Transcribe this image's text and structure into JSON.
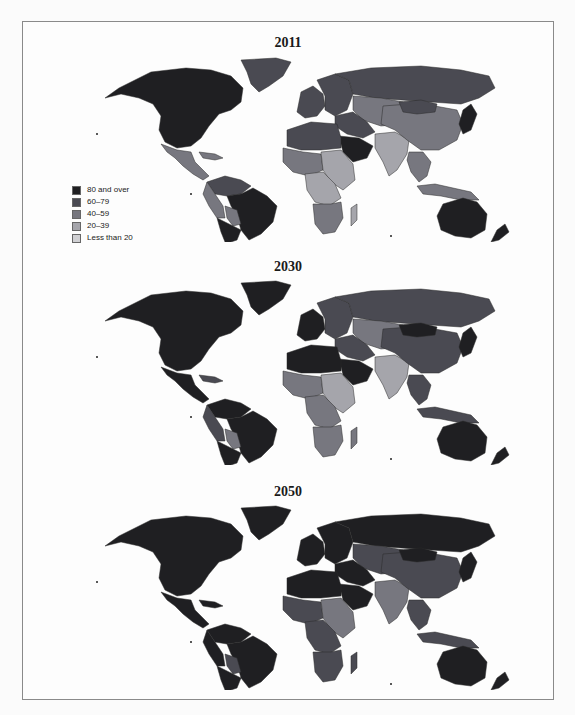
{
  "legend": {
    "items": [
      {
        "label": "80 and over",
        "color": "#1f1f22"
      },
      {
        "label": "60–79",
        "color": "#4a4a52"
      },
      {
        "label": "40–59",
        "color": "#77777f"
      },
      {
        "label": "20–39",
        "color": "#a5a5ab"
      },
      {
        "label": "Less than 20",
        "color": "#d0d0d3"
      }
    ]
  },
  "panels": [
    {
      "title": "2011",
      "regions": {
        "north_america": "80 and over",
        "greenland": "60–79",
        "mexico_central_america": "40–59",
        "caribbean": "40–59",
        "south_america_north": "60–79",
        "brazil": "80 and over",
        "andes_west": "40–59",
        "bolivia_paraguay": "40–59",
        "southern_cone": "80 and over",
        "western_europe": "60–79",
        "eastern_europe": "60–79",
        "russia": "60–79",
        "central_asia": "40–59",
        "middle_east": "60–79",
        "arabian_peninsula": "80 and over",
        "north_africa": "60–79",
        "west_africa": "40–59",
        "sahel_east_africa": "20–39",
        "central_africa": "20–39",
        "southern_africa": "40–59",
        "madagascar": "20–39",
        "south_asia": "20–39",
        "china": "40–59",
        "mongolia": "60–79",
        "japan_korea": "80 and over",
        "southeast_asia": "40–59",
        "indonesia": "40–59",
        "australia": "80 and over",
        "new_zealand": "80 and over"
      }
    },
    {
      "title": "2030",
      "regions": {
        "north_america": "80 and over",
        "greenland": "80 and over",
        "mexico_central_america": "80 and over",
        "caribbean": "60–79",
        "south_america_north": "80 and over",
        "brazil": "80 and over",
        "andes_west": "60–79",
        "bolivia_paraguay": "40–59",
        "southern_cone": "80 and over",
        "western_europe": "80 and over",
        "eastern_europe": "60–79",
        "russia": "60–79",
        "central_asia": "40–59",
        "middle_east": "60–79",
        "arabian_peninsula": "80 and over",
        "north_africa": "80 and over",
        "west_africa": "40–59",
        "sahel_east_africa": "20–39",
        "central_africa": "40–59",
        "southern_africa": "40–59",
        "madagascar": "40–59",
        "south_asia": "20–39",
        "china": "60–79",
        "mongolia": "80 and over",
        "japan_korea": "80 and over",
        "southeast_asia": "60–79",
        "indonesia": "60–79",
        "australia": "80 and over",
        "new_zealand": "80 and over"
      }
    },
    {
      "title": "2050",
      "regions": {
        "north_america": "80 and over",
        "greenland": "80 and over",
        "mexico_central_america": "80 and over",
        "caribbean": "80 and over",
        "south_america_north": "80 and over",
        "brazil": "80 and over",
        "andes_west": "80 and over",
        "bolivia_paraguay": "60–79",
        "southern_cone": "80 and over",
        "western_europe": "80 and over",
        "eastern_europe": "80 and over",
        "russia": "80 and over",
        "central_asia": "60–79",
        "middle_east": "80 and over",
        "arabian_peninsula": "80 and over",
        "north_africa": "80 and over",
        "west_africa": "60–79",
        "sahel_east_africa": "40–59",
        "central_africa": "60–79",
        "southern_africa": "60–79",
        "madagascar": "60–79",
        "south_asia": "40–59",
        "china": "60–79",
        "mongolia": "80 and over",
        "japan_korea": "80 and over",
        "southeast_asia": "60–79",
        "indonesia": "60–79",
        "australia": "80 and over",
        "new_zealand": "80 and over"
      }
    }
  ]
}
